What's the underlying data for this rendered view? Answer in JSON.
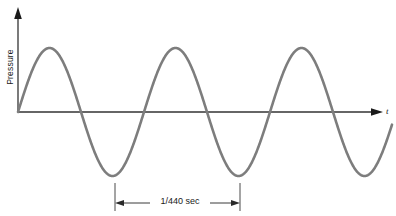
{
  "figure": {
    "type": "waveform-plot",
    "background_color": "#ffffff",
    "width": 396,
    "height": 216
  },
  "axes": {
    "y_label": "Pressure",
    "x_label": "t",
    "axis_color": "#333333",
    "origin": {
      "x": 18,
      "y": 112
    },
    "x_axis_end": {
      "x": 382,
      "y": 112
    },
    "y_axis_top": {
      "x": 18,
      "y": 10
    }
  },
  "annotation": {
    "period_label": "1/440 sec",
    "left_marker_x": 115,
    "right_marker_x": 240,
    "marker_top_y": 182,
    "arrow_y": 203
  },
  "chart_data": {
    "type": "line",
    "title": "",
    "xlabel": "t",
    "ylabel": "Pressure",
    "curve_color": "#7d7d7d",
    "waveform": "sine",
    "amplitude_px": 64,
    "period_px": 126,
    "phase": "starts at origin rising",
    "baseline_y": 112,
    "peak_y": 48,
    "trough_y": 176,
    "peaks_x": [
      50,
      177,
      303
    ],
    "troughs_x": [
      115,
      240,
      366
    ],
    "zero_crossings_x": [
      18,
      82,
      145,
      208,
      271,
      334
    ],
    "period_seconds": "1/440",
    "frequency_hz": 440,
    "grid": false,
    "legend": false
  }
}
